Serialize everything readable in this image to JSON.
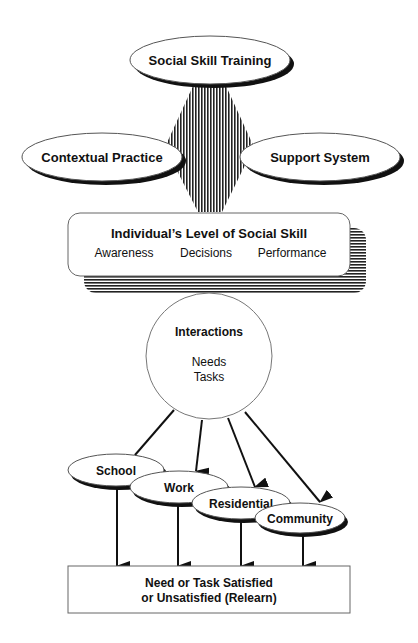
{
  "diagram": {
    "inputs": {
      "top": "Social Skill Training",
      "left": "Contextual Practice",
      "right": "Support System"
    },
    "level_box": {
      "title": "Individual’s Level of Social Skill",
      "components": [
        "Awareness",
        "Decisions",
        "Performance"
      ]
    },
    "interactions": {
      "title": "Interactions",
      "items": [
        "Needs",
        "Tasks"
      ]
    },
    "settings": [
      "School",
      "Work",
      "Residential",
      "Community"
    ],
    "outcome": {
      "line1": "Need or Task Satisfied",
      "line2": "or Unsatisfied (Relearn)"
    },
    "colors": {
      "stroke": "#111111",
      "fill": "#ffffff",
      "hatch": "#222222"
    }
  }
}
